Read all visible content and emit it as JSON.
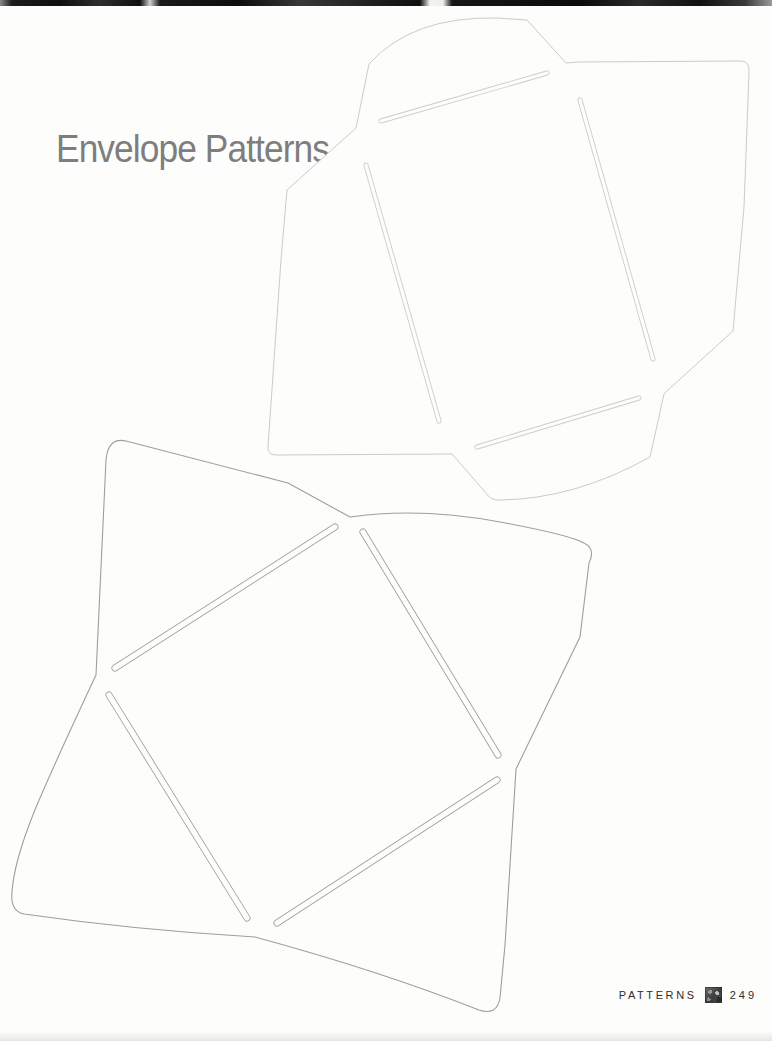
{
  "page": {
    "title": "Envelope Patterns",
    "footer": {
      "section_label": "PATTERNS",
      "page_number": "249",
      "icon": "photo-thumbnail-icon"
    }
  },
  "colors": {
    "paper": "#fdfdfc",
    "title_text": "#7e7e7e",
    "footer_text": "#2e2e2e",
    "scan_band": "#111111",
    "top_envelope_outline": "#cbcbcb",
    "bottom_envelope_outline": "#9e9e9e"
  },
  "envelopes": [
    {
      "name": "rectangular-envelope-pattern",
      "description": "open rectangular envelope template, rotated, four flaps with rounded corners and four slit cuts",
      "outline_color": "#cbcbcb",
      "stroke_width": 1,
      "slit_width": 5,
      "outline_path": "M356,128 L369,64 Q412,16 497,18 L527,20 L566,63 L578,62 L741,61 Q750,61 749,73 L744,207 L733,331 L668,390 L664,394 L650,457 Q575,499 500,500 Q491,501 486,493 L452,454 L276,455 Q267,455 268,446 L281,260 L287,190 Z",
      "slits": [
        [
          381,
          121,
          547,
          73
        ],
        [
          580,
          100,
          653,
          359
        ],
        [
          366,
          165,
          439,
          421
        ],
        [
          477,
          447,
          639,
          398
        ]
      ]
    },
    {
      "name": "square-envelope-pattern",
      "description": "square envelope template with four pointed flaps, rotated, four slit cuts around the center square",
      "outline_color": "#9e9e9e",
      "stroke_width": 1.1,
      "slit_width": 7,
      "outline_path": "M96,675 L106,460 Q108,437 126,441 L288,483 L350,517 Q420,507 500,522 Q570,535 584,543 Q596,549 589,563 L580,637 L516,769 L505,945 L500,998 Q497,1016 479,1010 Q380,971 255,937 Q135,930 24,914 Q10,911 12,892 C15,848 40,795 96,675 Z",
      "slits": [
        [
          335,
          527,
          115,
          668
        ],
        [
          363,
          532,
          498,
          755
        ],
        [
          497,
          780,
          277,
          923
        ],
        [
          109,
          695,
          247,
          918
        ]
      ]
    }
  ]
}
